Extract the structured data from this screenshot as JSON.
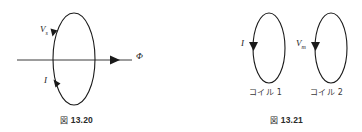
{
  "page": {
    "background_color": "#ffffff",
    "stroke_color": "#1a1a1a",
    "text_color": "#1a1a1a"
  },
  "figures": [
    {
      "id": "fig-13-20",
      "caption_mark": "図",
      "caption_number": "13.20",
      "description": "Single coil loop pierced by magnetic flux arrow",
      "labels": {
        "voltage": "V",
        "voltage_subscript": "s",
        "current": "I",
        "flux": "Φ"
      }
    },
    {
      "id": "fig-13-21",
      "caption_mark": "図",
      "caption_number": "13.21",
      "description": "Two separate coil loops side by side",
      "labels": {
        "current": "I",
        "voltage": "V",
        "voltage_subscript": "m",
        "coil_1": "コイル 1",
        "coil_2": "コイル 2"
      }
    }
  ]
}
